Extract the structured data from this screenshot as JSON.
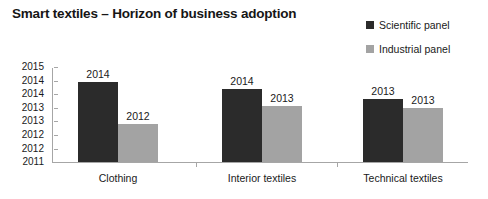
{
  "chart_data": {
    "type": "bar",
    "title": "Smart textiles – Horizon of business adoption",
    "xlabel": "",
    "ylabel": "",
    "ylim": [
      2011,
      2015
    ],
    "grid": false,
    "legend_position": "top-right",
    "categories": [
      "Clothing",
      "Interior textiles",
      "Technical textiles"
    ],
    "ytick_labels": [
      "2015",
      "2014",
      "2014",
      "2013",
      "2013",
      "2012",
      "2012",
      "2011"
    ],
    "ytick_values": [
      2015,
      2014.5,
      2014,
      2013.5,
      2013,
      2012.5,
      2012,
      2011
    ],
    "series": [
      {
        "name": "Scientific panel",
        "color": "#2b2b2b",
        "values": [
          2014.4,
          2014.1,
          2013.7
        ],
        "data_labels": [
          "2014",
          "2014",
          "2013"
        ]
      },
      {
        "name": "Industrial panel",
        "color": "#a3a3a3",
        "values": [
          2012.6,
          2013.4,
          2013.3
        ],
        "data_labels": [
          "2012",
          "2013",
          "2013"
        ]
      }
    ]
  }
}
